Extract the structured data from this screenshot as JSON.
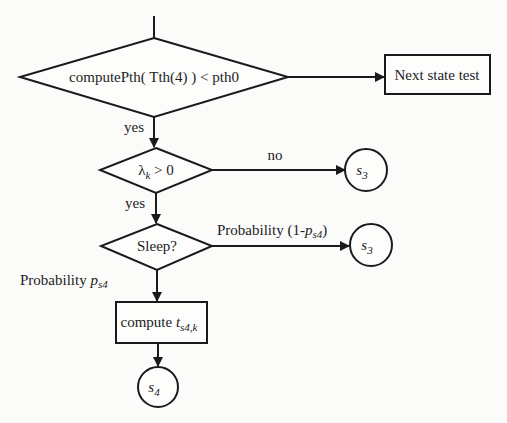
{
  "diagram": {
    "type": "flowchart",
    "nodes": {
      "decision1": {
        "shape": "diamond",
        "label": "computePth( Tth(4) ) < pth0"
      },
      "next_state": {
        "shape": "rectangle",
        "label": "Next state test"
      },
      "decision2": {
        "shape": "diamond",
        "label_main": "λ",
        "label_sub": "k",
        "label_rest": " > 0"
      },
      "s3_a": {
        "shape": "circle",
        "label": "s",
        "sub": "3"
      },
      "decision3": {
        "shape": "diamond",
        "label": "Sleep?"
      },
      "s3_b": {
        "shape": "circle",
        "label": "s",
        "sub": "3"
      },
      "compute": {
        "shape": "rectangle",
        "label": "compute ",
        "var": "t",
        "sub": "s4,k"
      },
      "s4": {
        "shape": "circle",
        "label": "s",
        "sub": "4"
      }
    },
    "edges": {
      "d1_yes": "yes",
      "d2_no": "no",
      "d2_yes": "yes",
      "d3_right_prefix": "Probability (1-",
      "d3_right_var": "p",
      "d3_right_sub": "s4",
      "d3_right_suffix": ")",
      "d3_down_prefix": "Probability ",
      "d3_down_var": "p",
      "d3_down_sub": "s4"
    }
  }
}
